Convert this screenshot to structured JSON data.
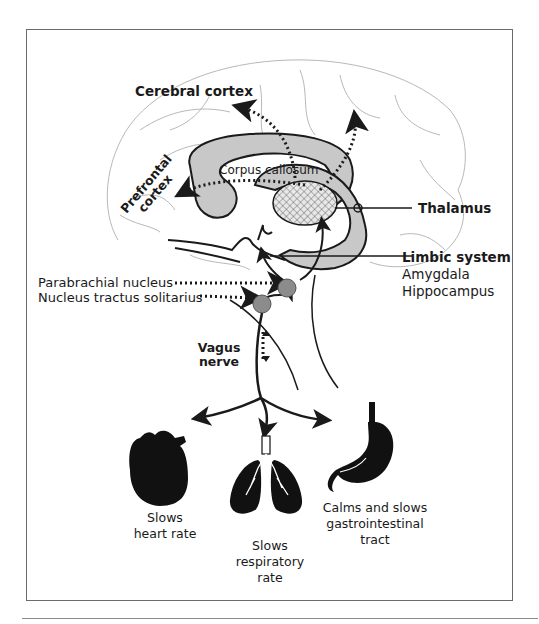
{
  "diagram": {
    "type": "anatomical-pathway",
    "labels": {
      "cerebral_cortex": "Cerebral cortex",
      "corpus_callosum": "Corpus callosum",
      "prefrontal_line1": "Prefrontal",
      "prefrontal_line2": "cortex",
      "thalamus": "Thalamus",
      "limbic_system": "Limbic system",
      "amygdala": "Amygdala",
      "hippocampus": "Hippocampus",
      "parabrachial": "Parabrachial nucleus",
      "nts": "Nucleus tractus solitarius",
      "vagus_line1": "Vagus",
      "vagus_line2": "nerve"
    },
    "organs": [
      {
        "name": "heart",
        "caption_line1": "Slows",
        "caption_line2": "heart rate"
      },
      {
        "name": "lungs",
        "caption_line1": "Slows",
        "caption_line2": "respiratory",
        "caption_line3": "rate"
      },
      {
        "name": "stomach",
        "caption_line1": "Calms and slows",
        "caption_line2": "gastrointestinal",
        "caption_line3": "tract"
      }
    ],
    "colors": {
      "line": "#1a1a1a",
      "brain_outline": "#b8b8b8",
      "fill_gray": "#c8c8c8",
      "nucleus_gray": "#8c8c8c",
      "frame": "#6a6a6a"
    }
  }
}
